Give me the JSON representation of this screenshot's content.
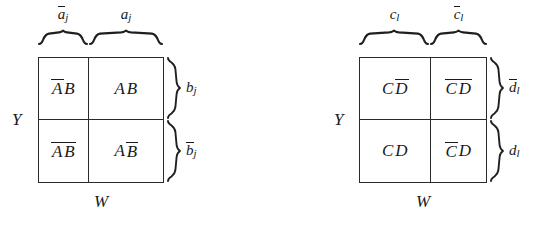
{
  "figure": {
    "type": "karnaugh-map-pair",
    "background_color": "#ffffff",
    "ink_color": "#1a1a1a"
  },
  "diagrams": [
    {
      "id": "left",
      "axis_vertical_label": "Y",
      "axis_horizontal_label": "W",
      "top_braces": [
        {
          "id": "top-left",
          "base": "a",
          "subscript": "j",
          "overbar": true,
          "text": "ā",
          "display": "āⱼ"
        },
        {
          "id": "top-right",
          "base": "a",
          "subscript": "j",
          "overbar": false,
          "text": "a",
          "display": "aⱼ"
        }
      ],
      "side_braces": [
        {
          "id": "side-top",
          "base": "b",
          "subscript": "j",
          "overbar": false
        },
        {
          "id": "side-bottom",
          "base": "b",
          "subscript": "j",
          "overbar": true
        }
      ],
      "cells": [
        {
          "id": "cell-tl",
          "row": 0,
          "col": 0,
          "tokens": [
            {
              "text": "A",
              "overbar": true
            },
            {
              "text": "B",
              "overbar": false
            }
          ]
        },
        {
          "id": "cell-tr",
          "row": 0,
          "col": 1,
          "tokens": [
            {
              "text": "A",
              "overbar": false
            },
            {
              "text": "B",
              "overbar": false
            }
          ]
        },
        {
          "id": "cell-bl",
          "row": 1,
          "col": 0,
          "tokens": [
            {
              "text": "A",
              "overbar": true
            },
            {
              "text": "B",
              "overbar": true
            }
          ]
        },
        {
          "id": "cell-br",
          "row": 1,
          "col": 1,
          "tokens": [
            {
              "text": "A",
              "overbar": false
            },
            {
              "text": "B",
              "overbar": true
            }
          ]
        }
      ]
    },
    {
      "id": "right",
      "axis_vertical_label": "Y",
      "axis_horizontal_label": "W",
      "top_braces": [
        {
          "id": "top-left",
          "base": "c",
          "subscript": "l",
          "overbar": false
        },
        {
          "id": "top-right",
          "base": "c",
          "subscript": "l",
          "overbar": true
        }
      ],
      "side_braces": [
        {
          "id": "side-top",
          "base": "d",
          "subscript": "l",
          "overbar": true
        },
        {
          "id": "side-bottom",
          "base": "d",
          "subscript": "l",
          "overbar": false
        }
      ],
      "cells": [
        {
          "id": "cell-tl",
          "row": 0,
          "col": 0,
          "tokens": [
            {
              "text": "C",
              "overbar": false
            },
            {
              "text": "D",
              "overbar": true
            }
          ]
        },
        {
          "id": "cell-tr",
          "row": 0,
          "col": 1,
          "tokens": [
            {
              "text": "C",
              "overbar": true
            },
            {
              "text": "D",
              "overbar": true
            }
          ]
        },
        {
          "id": "cell-bl",
          "row": 1,
          "col": 0,
          "tokens": [
            {
              "text": "C",
              "overbar": false
            },
            {
              "text": "D",
              "overbar": false
            }
          ]
        },
        {
          "id": "cell-br",
          "row": 1,
          "col": 1,
          "tokens": [
            {
              "text": "C",
              "overbar": true
            },
            {
              "text": "D",
              "overbar": false
            }
          ]
        }
      ]
    }
  ],
  "labels": {
    "left": {
      "Y": "Y",
      "W": "W",
      "top_left_base": "a",
      "top_left_sub": "j",
      "top_right_base": "a",
      "top_right_sub": "j",
      "side_top_base": "b",
      "side_top_sub": "j",
      "side_bottom_base": "b",
      "side_bottom_sub": "j",
      "cell_tl_1": "A",
      "cell_tl_2": "B",
      "cell_tr_1": "A",
      "cell_tr_2": "B",
      "cell_bl_1": "A",
      "cell_bl_2": "B",
      "cell_br_1": "A",
      "cell_br_2": "B"
    },
    "right": {
      "Y": "Y",
      "W": "W",
      "top_left_base": "c",
      "top_left_sub": "l",
      "top_right_base": "c",
      "top_right_sub": "l",
      "side_top_base": "d",
      "side_top_sub": "l",
      "side_bottom_base": "d",
      "side_bottom_sub": "l",
      "cell_tl_1": "C",
      "cell_tl_2": "D",
      "cell_tr_1": "C",
      "cell_tr_2": "D",
      "cell_bl_1": "C",
      "cell_bl_2": "D",
      "cell_br_1": "C",
      "cell_br_2": "D"
    }
  }
}
